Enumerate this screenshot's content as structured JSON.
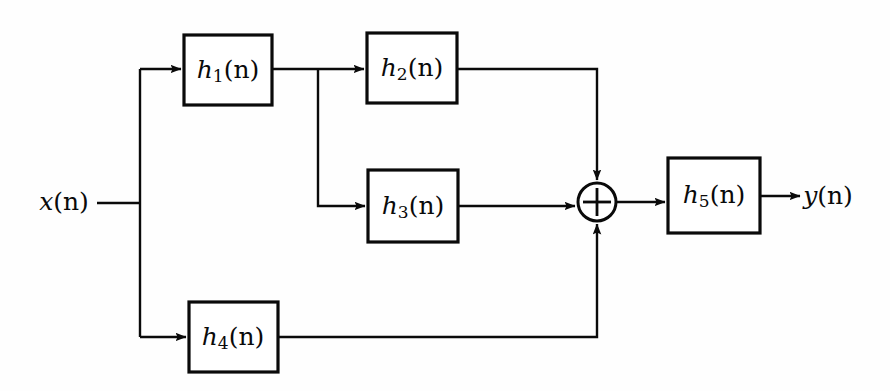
{
  "diagram": {
    "type": "signal-flow-block-diagram",
    "background_color": "#fefefe",
    "line_color": "#0a0a0a",
    "box_fill": "#ffffff",
    "input": {
      "name": "x(n)",
      "base": "x",
      "sub": "",
      "arg": "(n)",
      "x": 64,
      "y": 203
    },
    "output": {
      "name": "y(n)",
      "base": "y",
      "sub": "",
      "arg": "(n)",
      "x": 828,
      "y": 201
    },
    "blocks": [
      {
        "id": "h1",
        "label": "h1(n)",
        "base": "h",
        "sub": "1",
        "arg": "(n)",
        "x": 184,
        "y": 35,
        "w": 88,
        "h": 70
      },
      {
        "id": "h2",
        "label": "h2(n)",
        "base": "h",
        "sub": "2",
        "arg": "(n)",
        "x": 367,
        "y": 33,
        "w": 90,
        "h": 70
      },
      {
        "id": "h3",
        "label": "h3(n)",
        "base": "h",
        "sub": "3",
        "arg": "(n)",
        "x": 368,
        "y": 170,
        "w": 90,
        "h": 72
      },
      {
        "id": "h4",
        "label": "h4(n)",
        "base": "h",
        "sub": "4",
        "arg": "(n)",
        "x": 189,
        "y": 302,
        "w": 89,
        "h": 70
      },
      {
        "id": "h5",
        "label": "h5(n)",
        "base": "h",
        "sub": "5",
        "arg": "(n)",
        "x": 668,
        "y": 158,
        "w": 92,
        "h": 75
      }
    ],
    "adder": {
      "id": "summer",
      "symbol": "+",
      "cx": 597,
      "cy": 202,
      "r": 19
    },
    "nodes": [
      {
        "id": "input-split",
        "x": 140,
        "y": 203
      },
      {
        "id": "h1-out-split",
        "x": 318,
        "y": 69
      }
    ],
    "connections": [
      {
        "id": "x-to-split",
        "from": "x(n)",
        "to": "input-split"
      },
      {
        "id": "split-to-h1",
        "from": "input-split",
        "to": "h1"
      },
      {
        "id": "split-to-h4",
        "from": "input-split",
        "to": "h4"
      },
      {
        "id": "h1-to-split",
        "from": "h1",
        "to": "h1-out-split"
      },
      {
        "id": "h1split-to-h2",
        "from": "h1-out-split",
        "to": "h2"
      },
      {
        "id": "h1split-to-h3",
        "from": "h1-out-split",
        "to": "h3"
      },
      {
        "id": "h2-to-summer",
        "from": "h2",
        "to": "summer"
      },
      {
        "id": "h3-to-summer",
        "from": "h3",
        "to": "summer"
      },
      {
        "id": "h4-to-summer",
        "from": "h4",
        "to": "summer"
      },
      {
        "id": "summer-to-h5",
        "from": "summer",
        "to": "h5"
      },
      {
        "id": "h5-to-y",
        "from": "h5",
        "to": "y(n)"
      }
    ]
  }
}
